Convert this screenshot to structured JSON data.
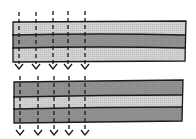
{
  "diagram": {
    "colors": {
      "light_layer": "#cfcfcf",
      "dark_layer": "#8f8f8f",
      "outline": "#1a1a1a",
      "arrow": "#1a1a1a",
      "background": "#ffffff"
    },
    "arrow_x_positions": [
      19,
      36,
      53,
      68,
      85
    ],
    "stacks": [
      {
        "id": "top",
        "layers": [
          "light",
          "dark",
          "light"
        ]
      },
      {
        "id": "bottom",
        "layers": [
          "dark",
          "light",
          "dark"
        ]
      }
    ]
  }
}
